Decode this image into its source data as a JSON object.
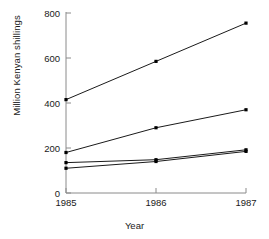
{
  "chart_data": {
    "type": "line",
    "title": "",
    "subtitle": "",
    "xlabel": "Year",
    "ylabel": "Million Kenyan shillings",
    "categories": [
      "1985",
      "1986",
      "1987"
    ],
    "x": [
      1985,
      1986,
      1987
    ],
    "xlim": [
      1985,
      1987
    ],
    "ylim": [
      0,
      800
    ],
    "yticks": [
      0,
      200,
      400,
      600,
      800
    ],
    "ytick_labels": [
      "0",
      "200",
      "400",
      "600",
      "800"
    ],
    "xticks": [
      1985,
      1986,
      1987
    ],
    "xtick_labels": [
      "1985",
      "1986",
      "1987"
    ],
    "grid": false,
    "legend": false,
    "legend_position": "none",
    "marker": "square",
    "line_color": "#000000",
    "marker_color": "#000000",
    "axis_color": "#8a8a8a",
    "background": "#ffffff",
    "series": [
      {
        "name": "series-1",
        "values": [
          415,
          585,
          755
        ]
      },
      {
        "name": "series-2",
        "values": [
          180,
          290,
          370
        ]
      },
      {
        "name": "series-3",
        "values": [
          135,
          148,
          192
        ]
      },
      {
        "name": "series-4",
        "values": [
          110,
          140,
          185
        ]
      }
    ]
  },
  "figure": {
    "ylabel_text": "Million Kenyan shillings",
    "xlabel_text": "Year",
    "footer_text": ""
  }
}
